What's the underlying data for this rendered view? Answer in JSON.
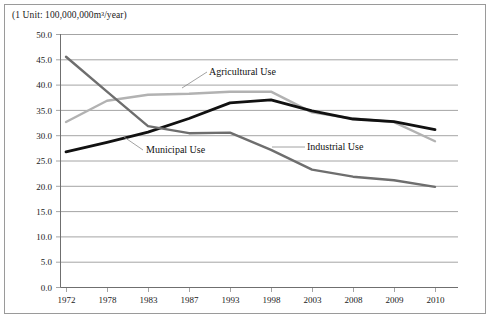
{
  "figure": {
    "unit_note": "(1 Unit: 100,000,000m³/year)"
  },
  "axis": {
    "y_ticks": [
      "50.0",
      "45.0",
      "40.0",
      "35.0",
      "30.0",
      "25.0",
      "20.0",
      "15.0",
      "10.0",
      "5.0",
      "0.0"
    ],
    "x_ticks": [
      "1972",
      "1978",
      "1983",
      "1987",
      "1993",
      "1998",
      "2003",
      "2008",
      "2009",
      "2010"
    ]
  },
  "labels": {
    "agricultural": "Agricultural Use",
    "municipal": "Municipal Use",
    "industrial": "Industrial Use"
  },
  "colors": {
    "agricultural": "#b2b2b2",
    "municipal": "#111111",
    "industrial": "#6e6e6e",
    "grid": "#8d8d8d",
    "border": "#9a9a9a",
    "text": "#1a1a1a"
  },
  "chart_data": {
    "type": "line",
    "title": "",
    "subtitle": "",
    "xlabel": "",
    "ylabel": "",
    "unit_note": "(1 Unit: 100,000,000m³/year)",
    "categories": [
      "1972",
      "1978",
      "1983",
      "1987",
      "1993",
      "1998",
      "2003",
      "2008",
      "2009",
      "2010"
    ],
    "ylim": [
      0.0,
      50.0
    ],
    "ytick_step": 5.0,
    "grid": true,
    "legend": "inline-annotations",
    "series": [
      {
        "name": "Agricultural Use",
        "color": "#b2b2b2",
        "values": [
          32.6,
          36.8,
          38.0,
          38.2,
          38.6,
          38.6,
          34.5,
          33.3,
          32.6,
          28.8
        ]
      },
      {
        "name": "Municipal Use",
        "color": "#111111",
        "values": [
          26.7,
          28.6,
          30.6,
          33.3,
          36.4,
          37.0,
          34.8,
          33.2,
          32.7,
          31.1
        ]
      },
      {
        "name": "Industrial Use",
        "color": "#6e6e6e",
        "values": [
          45.5,
          38.6,
          31.8,
          30.4,
          30.5,
          27.1,
          23.2,
          21.8,
          21.1,
          19.8
        ]
      }
    ]
  }
}
